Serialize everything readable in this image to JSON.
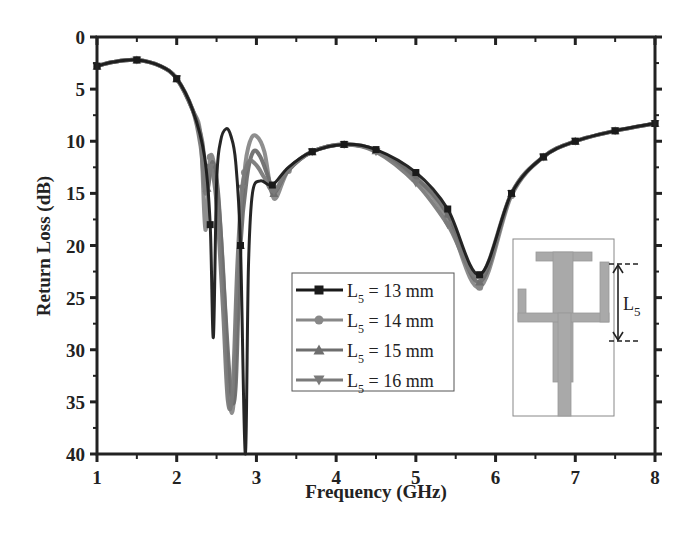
{
  "chart_data": {
    "type": "line",
    "title": "",
    "xlabel": "Frequency (GHz)",
    "ylabel": "Return Loss (dB)",
    "xlim": [
      1,
      8
    ],
    "ylim": [
      40,
      0
    ],
    "y_inverted": true,
    "x_ticks": [
      "1",
      "2",
      "3",
      "4",
      "5",
      "6",
      "7",
      "8"
    ],
    "y_ticks": [
      "0",
      "5",
      "10",
      "15",
      "20",
      "25",
      "30",
      "35",
      "40"
    ],
    "grid": false,
    "legend_position": "center-right inside",
    "series": [
      {
        "name": "L5 = 13 mm",
        "color": "#1a1a1a",
        "marker": "square",
        "x": [
          1.0,
          1.2,
          1.5,
          1.8,
          2.0,
          2.2,
          2.35,
          2.42,
          2.46,
          2.5,
          2.55,
          2.62,
          2.68,
          2.74,
          2.8,
          2.86,
          2.9,
          2.95,
          3.05,
          3.2,
          3.4,
          3.7,
          4.1,
          4.5,
          5.0,
          5.4,
          5.8,
          6.2,
          6.6,
          7.0,
          7.5,
          8.0
        ],
        "y": [
          2.8,
          2.4,
          2.2,
          2.8,
          4.0,
          7.0,
          11.5,
          18.0,
          28.8,
          14.0,
          10.0,
          8.8,
          9.5,
          12.0,
          20.0,
          40.0,
          22.0,
          15.0,
          13.8,
          14.2,
          12.5,
          11.0,
          10.3,
          10.8,
          13.0,
          16.5,
          22.8,
          15.0,
          11.5,
          10.0,
          9.0,
          8.3
        ]
      },
      {
        "name": "L5 = 14 mm",
        "color": "#888888",
        "marker": "circle",
        "x": [
          1.0,
          1.2,
          1.5,
          1.8,
          2.0,
          2.2,
          2.3,
          2.36,
          2.42,
          2.5,
          2.58,
          2.66,
          2.72,
          2.78,
          2.85,
          2.92,
          3.0,
          3.1,
          3.22,
          3.4,
          3.7,
          4.1,
          4.5,
          5.0,
          5.4,
          5.8,
          6.2,
          6.6,
          7.0,
          7.5,
          8.0
        ],
        "y": [
          2.8,
          2.4,
          2.2,
          2.8,
          4.0,
          7.0,
          9.5,
          18.5,
          11.5,
          14.0,
          22.0,
          34.5,
          34.5,
          22.0,
          13.0,
          10.0,
          9.5,
          11.0,
          15.5,
          12.8,
          11.0,
          10.3,
          10.9,
          13.5,
          17.5,
          24.0,
          15.2,
          11.5,
          10.0,
          9.0,
          8.3
        ]
      },
      {
        "name": "L5 = 15 mm",
        "color": "#6e6e6e",
        "marker": "triangle-up",
        "x": [
          1.0,
          1.2,
          1.5,
          1.8,
          2.0,
          2.2,
          2.32,
          2.38,
          2.45,
          2.52,
          2.6,
          2.68,
          2.74,
          2.8,
          2.88,
          2.96,
          3.05,
          3.15,
          3.22,
          3.4,
          3.7,
          4.1,
          4.5,
          5.0,
          5.4,
          5.8,
          6.2,
          6.6,
          7.0,
          7.5,
          8.0
        ],
        "y": [
          2.8,
          2.4,
          2.2,
          2.8,
          4.0,
          7.0,
          10.0,
          14.5,
          12.0,
          15.0,
          25.0,
          34.0,
          33.5,
          20.0,
          13.5,
          11.0,
          11.5,
          13.5,
          15.0,
          12.8,
          11.0,
          10.3,
          10.9,
          13.5,
          17.0,
          23.5,
          15.0,
          11.5,
          10.0,
          9.0,
          8.3
        ]
      },
      {
        "name": "L5 = 16 mm",
        "color": "#7a7a7a",
        "marker": "triangle-down",
        "x": [
          1.0,
          1.2,
          1.5,
          1.8,
          2.0,
          2.2,
          2.3,
          2.36,
          2.42,
          2.5,
          2.58,
          2.64,
          2.7,
          2.76,
          2.82,
          2.9,
          3.0,
          3.1,
          3.22,
          3.4,
          3.7,
          4.1,
          4.5,
          5.0,
          5.4,
          5.8,
          6.2,
          6.6,
          7.0,
          7.5,
          8.0
        ],
        "y": [
          2.8,
          2.4,
          2.2,
          2.8,
          4.0,
          7.0,
          10.5,
          15.0,
          12.5,
          16.0,
          26.0,
          34.8,
          34.0,
          22.0,
          14.5,
          12.0,
          12.3,
          13.5,
          14.8,
          12.7,
          11.0,
          10.3,
          11.0,
          14.0,
          18.0,
          23.0,
          15.0,
          11.5,
          10.0,
          9.0,
          8.3
        ]
      }
    ],
    "annotations": [
      "Inset antenna geometry sketch with dimension label L5"
    ]
  },
  "axes": {
    "xlabel": "Frequency (GHz)",
    "ylabel": "Return Loss (dB)",
    "x_ticks": [
      "1",
      "2",
      "3",
      "4",
      "5",
      "6",
      "7",
      "8"
    ],
    "y_ticks": [
      "0",
      "5",
      "10",
      "15",
      "20",
      "25",
      "30",
      "35",
      "40"
    ]
  },
  "legend": {
    "items": [
      {
        "prefix": "L",
        "sub": "5",
        "suffix": " = 13 mm"
      },
      {
        "prefix": "L",
        "sub": "5",
        "suffix": " = 14 mm"
      },
      {
        "prefix": "L",
        "sub": "5",
        "suffix": " = 15 mm"
      },
      {
        "prefix": "L",
        "sub": "5",
        "suffix": " = 16 mm"
      }
    ]
  },
  "inset": {
    "label_main": "L",
    "label_sub": "5",
    "fill_color": "#a9a9a9"
  }
}
